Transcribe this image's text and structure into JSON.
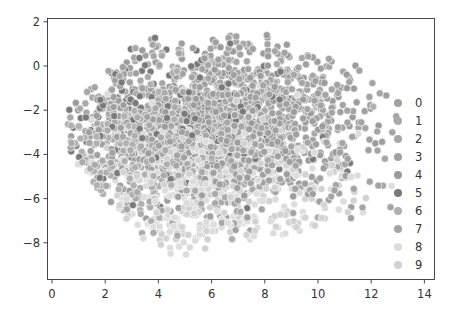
{
  "chart_data": {
    "type": "scatter",
    "title": "",
    "xlabel": "",
    "ylabel": "",
    "xlim": [
      -0.3,
      14.5
    ],
    "ylim": [
      -9.6,
      2.2
    ],
    "grid": false,
    "x_ticks": [
      "0",
      "2",
      "4",
      "6",
      "8",
      "10",
      "12",
      "14"
    ],
    "x_tick_values": [
      0,
      2,
      4,
      6,
      8,
      10,
      12,
      14
    ],
    "y_ticks": [
      "2",
      "0",
      "−2",
      "−4",
      "−6",
      "−8"
    ],
    "y_tick_values": [
      2,
      0,
      -2,
      -4,
      -6,
      -8
    ],
    "legend_position": "right-inside",
    "legend": [
      {
        "label": "0",
        "color": "#a0a0a0"
      },
      {
        "label": "1",
        "color": "#aaaaaa"
      },
      {
        "label": "2",
        "color": "#a6a6a6"
      },
      {
        "label": "3",
        "color": "#a0a0a0"
      },
      {
        "label": "4",
        "color": "#9c9c9c"
      },
      {
        "label": "5",
        "color": "#7a7a7a"
      },
      {
        "label": "6",
        "color": "#b0b0b0"
      },
      {
        "label": "7",
        "color": "#a4a4a4"
      },
      {
        "label": "8",
        "color": "#dcdcdc"
      },
      {
        "label": "9",
        "color": "#d2d2d2"
      }
    ],
    "point_cloud": {
      "description": "Dense 2D embedding of 10 classes; points overlap heavily",
      "approx_points": 2600,
      "x_range": [
        0.6,
        13.0
      ],
      "y_range": [
        -9.2,
        1.6
      ],
      "class_centers": [
        {
          "label": "0",
          "x": 5.5,
          "y": -3.0
        },
        {
          "label": "1",
          "x": 4.0,
          "y": -3.5
        },
        {
          "label": "2",
          "x": 6.0,
          "y": -2.5
        },
        {
          "label": "3",
          "x": 6.5,
          "y": -3.0
        },
        {
          "label": "4",
          "x": 7.0,
          "y": -2.0
        },
        {
          "label": "5",
          "x": 4.5,
          "y": -2.5
        },
        {
          "label": "6",
          "x": 3.0,
          "y": -4.0
        },
        {
          "label": "7",
          "x": 7.5,
          "y": -1.5
        },
        {
          "label": "8",
          "x": 5.0,
          "y": -6.0
        },
        {
          "label": "9",
          "x": 6.5,
          "y": -5.5
        }
      ]
    }
  }
}
